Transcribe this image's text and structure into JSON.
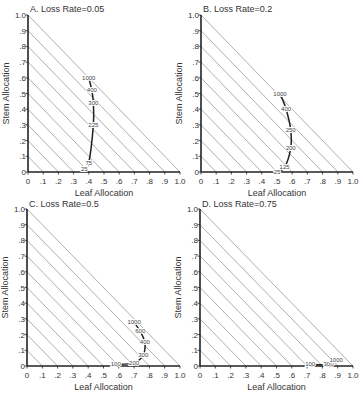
{
  "chart_data": [
    {
      "type": "line",
      "title": "A. Loss Rate=0.05",
      "xlabel": "Leaf Allocation",
      "ylabel": "Stem Allocation",
      "xlim": [
        0,
        1.0
      ],
      "ylim": [
        0,
        1.0
      ],
      "x_ticks": [
        "0",
        ".1",
        ".2",
        ".3",
        ".4",
        ".5",
        ".6",
        ".7",
        ".8",
        ".9",
        "1.0"
      ],
      "y_ticks": [
        "0",
        ".1",
        ".2",
        ".3",
        ".4",
        ".5",
        ".6",
        ".7",
        ".8",
        ".9",
        "1.0"
      ],
      "grid": "diagonal isolines x+y=c for c=0.1..1.0",
      "series": [
        {
          "name": "optimal allocation trajectory",
          "points": [
            {
              "label": "25",
              "x": 0.37,
              "y": 0.02
            },
            {
              "label": "75",
              "x": 0.4,
              "y": 0.06
            },
            {
              "label": "225",
              "x": 0.43,
              "y": 0.3
            },
            {
              "label": "300",
              "x": 0.43,
              "y": 0.44
            },
            {
              "label": "400",
              "x": 0.42,
              "y": 0.52
            },
            {
              "label": "1000",
              "x": 0.4,
              "y": 0.6
            }
          ]
        }
      ]
    },
    {
      "type": "line",
      "title": "B. Loss Rate=0.2",
      "xlabel": "Leaf Allocation",
      "ylabel": "Stem Allocation",
      "xlim": [
        0,
        1.0
      ],
      "ylim": [
        0,
        1.0
      ],
      "x_ticks": [
        "0",
        ".1",
        ".2",
        ".3",
        ".4",
        ".5",
        ".6",
        ".7",
        ".8",
        ".9",
        "1.0"
      ],
      "y_ticks": [
        "0",
        ".1",
        ".2",
        ".3",
        ".4",
        ".5",
        ".6",
        ".7",
        ".8",
        ".9",
        "1.0"
      ],
      "grid": "diagonal isolines x+y=c for c=0.1..1.0",
      "series": [
        {
          "name": "optimal allocation trajectory",
          "points": [
            {
              "label": "25",
              "x": 0.5,
              "y": 0.0
            },
            {
              "label": "125",
              "x": 0.55,
              "y": 0.03
            },
            {
              "label": "200",
              "x": 0.59,
              "y": 0.15
            },
            {
              "label": "250",
              "x": 0.59,
              "y": 0.27
            },
            {
              "label": "400",
              "x": 0.56,
              "y": 0.4
            },
            {
              "label": "1000",
              "x": 0.52,
              "y": 0.5
            }
          ]
        }
      ]
    },
    {
      "type": "line",
      "title": "C. Loss Rate=0.5",
      "xlabel": "Leaf Allocation",
      "ylabel": "Stem Allocation",
      "xlim": [
        0,
        1.0
      ],
      "ylim": [
        0,
        1.0
      ],
      "x_ticks": [
        "0",
        ".1",
        ".2",
        ".3",
        ".4",
        ".5",
        ".6",
        ".7",
        ".8",
        ".9",
        "1.0"
      ],
      "y_ticks": [
        "0",
        ".1",
        ".2",
        ".3",
        ".4",
        ".5",
        ".6",
        ".7",
        ".8",
        ".9",
        "1.0"
      ],
      "grid": "diagonal isolines x+y=c for c=0.1..1.0",
      "series": [
        {
          "name": "optimal allocation trajectory",
          "points": [
            {
              "label": "100",
              "x": 0.58,
              "y": 0.01
            },
            {
              "label": "200",
              "x": 0.7,
              "y": 0.02
            },
            {
              "label": "300",
              "x": 0.76,
              "y": 0.07
            },
            {
              "label": "400",
              "x": 0.77,
              "y": 0.15
            },
            {
              "label": "600",
              "x": 0.74,
              "y": 0.22
            },
            {
              "label": "1000",
              "x": 0.7,
              "y": 0.28
            }
          ]
        }
      ]
    },
    {
      "type": "line",
      "title": "D. Loss Rate=0.75",
      "xlabel": "Leaf Allocation",
      "ylabel": "Stem Allocation",
      "xlim": [
        0,
        1.0
      ],
      "ylim": [
        0,
        1.0
      ],
      "x_ticks": [
        "0",
        ".1",
        ".2",
        ".3",
        ".4",
        ".5",
        ".6",
        ".7",
        ".8",
        ".9",
        "1.0"
      ],
      "y_ticks": [
        "0",
        ".1",
        ".2",
        ".3",
        ".4",
        ".5",
        ".6",
        ".7",
        ".8",
        ".9",
        "1.0"
      ],
      "grid": "diagonal isolines x+y=c for c=0.1..1.0",
      "series": [
        {
          "name": "optimal allocation trajectory",
          "points": [
            {
              "label": "100",
              "x": 0.72,
              "y": 0.01
            },
            {
              "label": "300",
              "x": 0.84,
              "y": 0.01
            },
            {
              "label": "1000",
              "x": 0.89,
              "y": 0.04
            }
          ]
        }
      ]
    }
  ],
  "panels": [
    {
      "id": "A",
      "x0": 28,
      "y0": 172,
      "w": 152,
      "h": 157,
      "title_x": 30,
      "title_y": 12
    },
    {
      "id": "B",
      "x0": 201,
      "y0": 172,
      "w": 152,
      "h": 157,
      "title_x": 203,
      "title_y": 12
    },
    {
      "id": "C",
      "x0": 27,
      "y0": 366,
      "w": 153,
      "h": 157,
      "title_x": 29,
      "title_y": 207
    },
    {
      "id": "D",
      "x0": 200,
      "y0": 366,
      "w": 153,
      "h": 157,
      "title_x": 202,
      "title_y": 207
    }
  ],
  "colors": {
    "axis": "#222222",
    "isoline": "#9a9a9a",
    "curve": "#222222",
    "text": "#333333"
  }
}
